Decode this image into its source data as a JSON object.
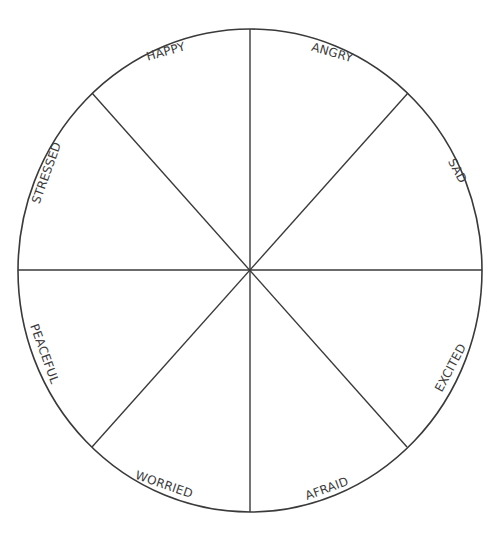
{
  "diagram": {
    "type": "emotion-wheel",
    "segment_count": 8,
    "stroke_color": "#3a3a3a",
    "background": "#ffffff",
    "label_color": "#3c3c3c",
    "segments": [
      {
        "label": "HAPPY",
        "position": "top-left"
      },
      {
        "label": "ANGRY",
        "position": "top-right"
      },
      {
        "label": "SAD",
        "position": "right-upper"
      },
      {
        "label": "EXCITED",
        "position": "right-lower"
      },
      {
        "label": "AFRAID",
        "position": "bottom-right"
      },
      {
        "label": "WORRIED",
        "position": "bottom-left"
      },
      {
        "label": "PEACEFUL",
        "position": "left-lower"
      },
      {
        "label": "STRESSED",
        "position": "left-upper"
      }
    ]
  }
}
